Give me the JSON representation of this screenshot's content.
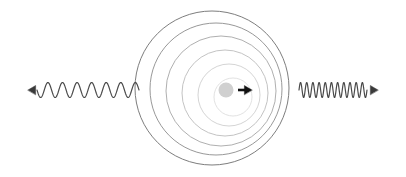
{
  "figure": {
    "background_color": "#ffffff",
    "width": 406,
    "height": 177
  },
  "source": {
    "label": "moving-source",
    "center_x": 226,
    "center_y": 90,
    "radius": 7.5,
    "fill_color": "#d0d0d0",
    "motion_arrow": {
      "label": "velocity-arrow",
      "direction": "right",
      "x1": 238,
      "x2": 252,
      "y": 90,
      "color": "#111111",
      "stroke_width": 2.6,
      "head_size": 4.5
    }
  },
  "wavefronts": {
    "label": "concentric-wavefront-circles",
    "count": 6,
    "circles": [
      {
        "cx": 212,
        "cy": 88,
        "r": 77,
        "stroke": "#6e6e6e",
        "stroke_width": 0.9
      },
      {
        "cx": 216,
        "cy": 89,
        "r": 66,
        "stroke": "#8c8c8c",
        "stroke_width": 0.9
      },
      {
        "cx": 221,
        "cy": 91,
        "r": 55,
        "stroke": "#a6a6a6",
        "stroke_width": 0.9
      },
      {
        "cx": 225,
        "cy": 93,
        "r": 43,
        "stroke": "#bcbcbc",
        "stroke_width": 0.9
      },
      {
        "cx": 229,
        "cy": 95,
        "r": 31,
        "stroke": "#cfcfcf",
        "stroke_width": 0.9
      },
      {
        "cx": 233,
        "cy": 97,
        "r": 19,
        "stroke": "#dedede",
        "stroke_width": 0.9
      }
    ]
  },
  "left_wave": {
    "label": "redshifted-wave",
    "description": "long wavelength wave travelling left",
    "x_start": 139,
    "x_end": 37,
    "baseline_y": 90,
    "amplitude": 7.5,
    "cycles": 7,
    "color": "#4a4a4a",
    "stroke_width": 1.2,
    "arrow": {
      "label": "left-arrowhead",
      "direction": "left",
      "tip_x": 28,
      "tail_x": 37,
      "y": 90,
      "color": "#3a3a3a",
      "head_size": 4.5
    }
  },
  "right_wave": {
    "label": "blueshifted-wave",
    "description": "short wavelength wave travelling right",
    "x_start": 299,
    "x_end": 367,
    "baseline_y": 90,
    "amplitude": 7.5,
    "cycles": 11,
    "color": "#4a4a4a",
    "stroke_width": 1.2,
    "arrow": {
      "label": "right-arrowhead",
      "direction": "right",
      "tip_x": 378,
      "tail_x": 367,
      "y": 90,
      "color": "#3a3a3a",
      "head_size": 4.5
    }
  },
  "chart_data": {
    "type": "line",
    "xlabel": "",
    "ylabel": "",
    "series": [
      {
        "name": "redshifted-wave-left",
        "wavelength_px": 14.6,
        "cycles": 7,
        "amplitude_px": 7.5,
        "x_range": [
          37,
          139
        ],
        "baseline_y": 90,
        "direction": "left"
      },
      {
        "name": "blueshifted-wave-right",
        "wavelength_px": 6.2,
        "cycles": 11,
        "amplitude_px": 7.5,
        "x_range": [
          299,
          367
        ],
        "baseline_y": 90,
        "direction": "right"
      }
    ],
    "wavefront_radii": [
      19,
      31,
      43,
      55,
      66,
      77
    ],
    "wavefront_center_x": [
      233,
      229,
      225,
      221,
      216,
      212
    ],
    "wavefront_center_y": [
      97,
      95,
      93,
      91,
      89,
      88
    ],
    "source_position": [
      226,
      90
    ],
    "source_velocity_direction": "right",
    "grid": false,
    "legend": "none"
  }
}
